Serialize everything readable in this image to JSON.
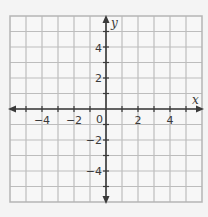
{
  "figure": {
    "type": "coordinate-plane",
    "x_axis": {
      "label": "x",
      "min": -6,
      "max": 6,
      "grid_step": 1,
      "tick_labels": [
        "−4",
        "−2",
        "2",
        "4"
      ],
      "tick_values": [
        -4,
        -2,
        2,
        4
      ]
    },
    "y_axis": {
      "label": "y",
      "min": -6,
      "max": 6,
      "grid_step": 1,
      "tick_labels": [
        "4",
        "2",
        "−2",
        "−4"
      ],
      "tick_values": [
        4,
        2,
        -2,
        -4
      ]
    },
    "origin_label": "0",
    "colors": {
      "background": "#f4f4f4",
      "grid_fill": "#f7f7f7",
      "grid_line": "#bdbdbd",
      "axis_line": "#3a3a3a",
      "label": "#3a3a3a"
    }
  }
}
